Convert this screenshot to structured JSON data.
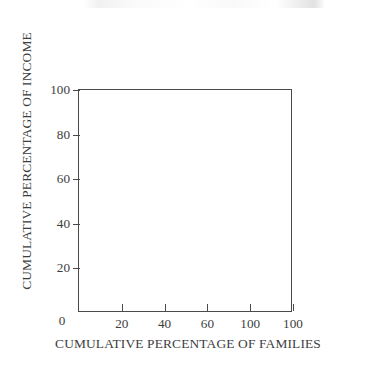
{
  "figure": {
    "background_color": "#ffffff",
    "line_color": "#4a4a4a",
    "text_color": "#3d3d3d",
    "origin_label": "0"
  },
  "chart_data": {
    "type": "line",
    "title": "",
    "subtitle": "",
    "xlabel": "CUMULATIVE PERCENTAGE OF FAMILIES",
    "ylabel": "CUMULATIVE PERCENTAGE OF INCOME",
    "xlim": [
      0,
      100
    ],
    "ylim": [
      0,
      100
    ],
    "grid": false,
    "legend": false,
    "legend_position": "none",
    "series": [],
    "annotations": [],
    "note": "Blank Lorenz-curve axis template: plot area contains no plotted data.",
    "x_ticks": [
      {
        "value": 0,
        "label": "0"
      },
      {
        "value": 20,
        "label": "20"
      },
      {
        "value": 40,
        "label": "40"
      },
      {
        "value": 60,
        "label": "60"
      },
      {
        "value": 80,
        "label": "100"
      },
      {
        "value": 100,
        "label": "100"
      }
    ],
    "y_ticks": [
      {
        "value": 20,
        "label": "20"
      },
      {
        "value": 40,
        "label": "40"
      },
      {
        "value": 60,
        "label": "60"
      },
      {
        "value": 80,
        "label": "80"
      },
      {
        "value": 100,
        "label": "100"
      }
    ]
  }
}
